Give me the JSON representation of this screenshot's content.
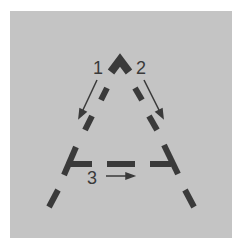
{
  "diagram": {
    "letter": "A",
    "background_color": "#c4c4c4",
    "stroke_color": "#3a3a3a",
    "steps": [
      {
        "label": "1",
        "direction": "down-left"
      },
      {
        "label": "2",
        "direction": "down-right"
      },
      {
        "label": "3",
        "direction": "right"
      }
    ]
  }
}
